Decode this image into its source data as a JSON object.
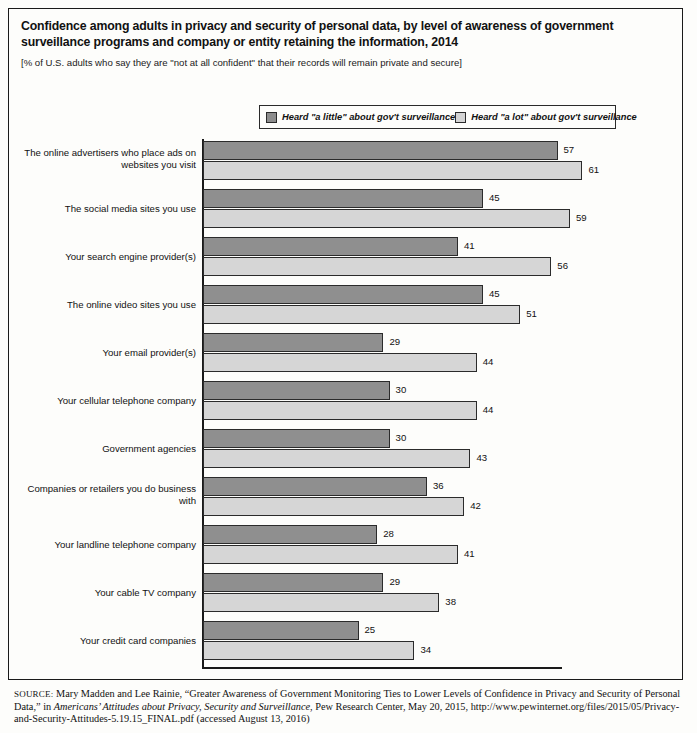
{
  "title": "Confidence among adults in privacy and security of personal data, by level of awareness of government surveillance programs and company or entity retaining the information, 2014",
  "subtitle": "[% of U.S. adults who say they are \"not at all confident\" that their records will remain private and secure]",
  "legend": {
    "items": [
      {
        "label": "Heard \"a little\" about gov't surveillance",
        "color": "#8f8f8f",
        "swatch": "dark"
      },
      {
        "label": "Heard \"a lot\" about gov't surveillance",
        "color": "#d6d6d6",
        "swatch": "light"
      }
    ]
  },
  "source": {
    "prefix": "SOURCE:",
    "text_a": " Mary Madden and Lee Rainie, “Greater Awareness of Government Monitoring Ties to Lower Levels of Confidence in Privacy and Security of Personal Data,” in ",
    "italic": "Americans’ Attitudes about Privacy, Security and Surveillance",
    "text_b": ", Pew Research Center, May 20, 2015, http://www.pewinternet.org/files/2015/05/Privacy-and-Security-Attitudes-5.19.15_FINAL.pdf (accessed August 13, 2016)"
  },
  "chart_data": {
    "type": "bar",
    "orientation": "horizontal",
    "title": "Confidence among adults in privacy and security of personal data, by level of awareness of government surveillance programs and company or entity retaining the information, 2014",
    "subtitle": "[% of U.S. adults who say they are \"not at all confident\" that their records will remain private and secure]",
    "xlabel": "",
    "ylabel": "",
    "xlim": [
      0,
      70
    ],
    "grid": false,
    "legend_position": "top-center",
    "categories": [
      "The online advertisers who place ads on websites you visit",
      "The social media sites you use",
      "Your search engine provider(s)",
      "The online video sites you use",
      "Your email provider(s)",
      "Your cellular telephone company",
      "Government agencies",
      "Companies or retailers you do business with",
      "Your landline telephone company",
      "Your cable TV company",
      "Your credit card companies"
    ],
    "series": [
      {
        "name": "Heard \"a little\" about gov't surveillance",
        "color": "#8f8f8f",
        "values": [
          57,
          45,
          41,
          45,
          29,
          30,
          30,
          36,
          28,
          29,
          25
        ]
      },
      {
        "name": "Heard \"a lot\" about gov't surveillance",
        "color": "#d6d6d6",
        "values": [
          61,
          59,
          56,
          51,
          44,
          44,
          43,
          42,
          41,
          38,
          34
        ]
      }
    ]
  }
}
